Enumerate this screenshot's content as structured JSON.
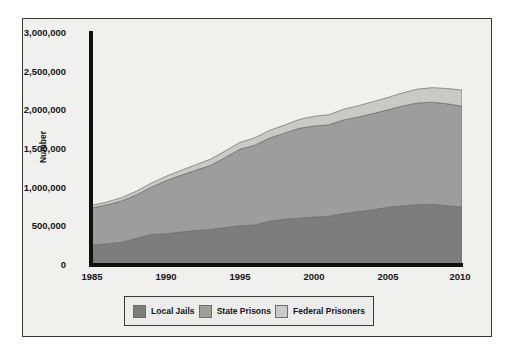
{
  "chart_data": {
    "type": "area",
    "title": "",
    "subtitle": "",
    "xlabel": "",
    "ylabel": "Number",
    "stacked": true,
    "grid": false,
    "legend_position": "bottom",
    "xlim": [
      1985,
      2010
    ],
    "ylim": [
      0,
      3000000
    ],
    "x_ticks": [
      "1985",
      "1990",
      "1995",
      "2000",
      "2005",
      "2010"
    ],
    "y_ticks": [
      "0",
      "500,000",
      "1,000,000",
      "1,500,000",
      "2,000,000",
      "2,500,000",
      "3,000,000"
    ],
    "y_tick_values": [
      0,
      500000,
      1000000,
      1500000,
      2000000,
      2500000,
      3000000
    ],
    "x": [
      1985,
      1986,
      1987,
      1988,
      1989,
      1990,
      1991,
      1992,
      1993,
      1994,
      1995,
      1996,
      1997,
      1998,
      1999,
      2000,
      2001,
      2002,
      2003,
      2004,
      2005,
      2006,
      2007,
      2008,
      2009,
      2010
    ],
    "series": [
      {
        "name": "Local Jails",
        "color": "#7d7d7d",
        "values": [
          256000,
          274000,
          295000,
          343000,
          395000,
          405000,
          426000,
          445000,
          459000,
          486000,
          507000,
          518000,
          567000,
          592000,
          605000,
          621000,
          631000,
          665000,
          691000,
          714000,
          747000,
          766000,
          780000,
          785000,
          767000,
          749000
        ]
      },
      {
        "name": "State Prisons",
        "color": "#9d9d9d",
        "values": [
          481000,
          503000,
          533000,
          562000,
          610000,
          684000,
          733000,
          779000,
          828000,
          904000,
          989000,
          1032000,
          1075000,
          1113000,
          1162000,
          1176000,
          1181000,
          1210000,
          1223000,
          1244000,
          1259000,
          1291000,
          1315000,
          1320000,
          1317000,
          1304000
        ]
      },
      {
        "name": "Federal Prisoners",
        "color": "#c9c9c7",
        "values": [
          35000,
          37000,
          44000,
          49000,
          53000,
          58000,
          63000,
          72000,
          80000,
          85000,
          89000,
          95000,
          99000,
          104000,
          115000,
          125000,
          131000,
          139000,
          146000,
          154000,
          161000,
          170000,
          179000,
          188000,
          198000,
          209000
        ]
      }
    ],
    "totals_note": {
      "1985": 772000,
      "2010": 2262000
    }
  },
  "legend": {
    "items": [
      {
        "label": "Local Jails",
        "color": "#7d7d7d"
      },
      {
        "label": "State Prisons",
        "color": "#9d9d9d"
      },
      {
        "label": "Federal Prisoners",
        "color": "#c9c9c7"
      }
    ]
  },
  "axes": {
    "y_title": "Number"
  },
  "colors": {
    "panel_background": "#f0f0ee",
    "page_background": "#ffffff",
    "frame": "#3a3a3a",
    "axis": "#111111",
    "text": "#151515"
  }
}
